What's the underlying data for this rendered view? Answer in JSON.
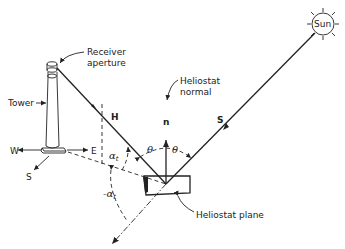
{
  "diagram": {
    "labels": {
      "receiver_line1": "Receiver",
      "receiver_line2": "aperture",
      "tower": "Tower",
      "west": "W",
      "east": "E",
      "south": "S",
      "h_vector": "H",
      "normal_vector": "n",
      "s_vector": "S",
      "sun": "Sun",
      "heliostat_normal_line1": "Heliostat",
      "heliostat_normal_line2": "normal",
      "heliostat_plane": "Heliostat plane",
      "theta_left": "θ",
      "theta_right": "θ",
      "alpha": "α",
      "alpha_sub": "t",
      "neg_alpha": "-α",
      "neg_alpha_sub": "t"
    },
    "colors": {
      "ink": "#222222",
      "background": "#ffffff"
    }
  }
}
